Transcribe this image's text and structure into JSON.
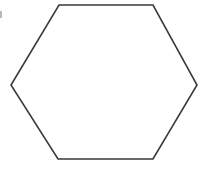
{
  "canvas": {
    "width": 206,
    "height": 179,
    "background_color": "#ffffff"
  },
  "figure": {
    "name": "hexagon",
    "label": "hexagon",
    "shape_type": "regular-hexagon",
    "orientation": "flat-top",
    "sides": 6,
    "fill": "none",
    "stroke_color": "#3a3a3a",
    "stroke_width": 1.6,
    "vertex_count": 6,
    "points": "59,5 153,5 197,85 153,159 58,159 11,85",
    "vertices": [
      {
        "name": "top-left-vertex",
        "x": 59,
        "y": 5
      },
      {
        "name": "top-right-vertex",
        "x": 153,
        "y": 5
      },
      {
        "name": "right-vertex",
        "x": 197,
        "y": 85
      },
      {
        "name": "bottom-right-vertex",
        "x": 153,
        "y": 159
      },
      {
        "name": "bottom-left-vertex",
        "x": 58,
        "y": 159
      },
      {
        "name": "left-vertex",
        "x": 11,
        "y": 85
      }
    ],
    "edges": [
      {
        "name": "top-edge",
        "from": "top-left-vertex",
        "to": "top-right-vertex"
      },
      {
        "name": "upper-right-edge",
        "from": "top-right-vertex",
        "to": "right-vertex"
      },
      {
        "name": "lower-right-edge",
        "from": "right-vertex",
        "to": "bottom-right-vertex"
      },
      {
        "name": "bottom-edge",
        "from": "bottom-right-vertex",
        "to": "bottom-left-vertex"
      },
      {
        "name": "lower-left-edge",
        "from": "bottom-left-vertex",
        "to": "left-vertex"
      },
      {
        "name": "upper-left-edge",
        "from": "left-vertex",
        "to": "top-left-vertex"
      }
    ],
    "bounding_box": {
      "x": 11,
      "y": 5,
      "width": 186,
      "height": 154
    }
  },
  "artifacts": [
    {
      "name": "scan-speck",
      "x": 0,
      "y": 11,
      "width": 2,
      "height": 7,
      "color": "#b9b9b9"
    }
  ]
}
